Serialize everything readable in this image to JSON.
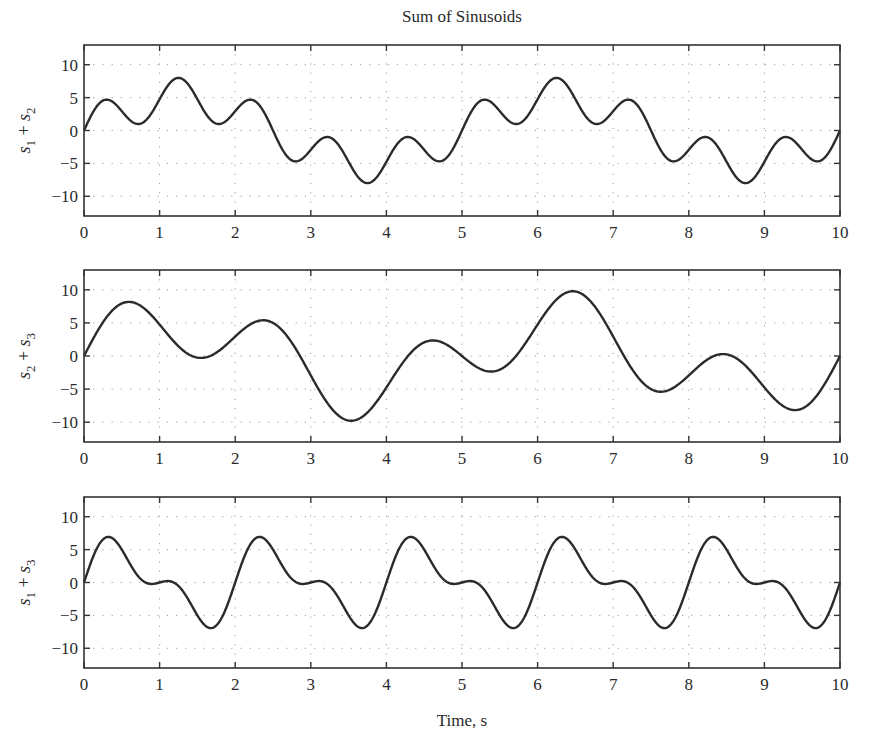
{
  "figure": {
    "title": "Sum of Sinusoids",
    "xlabel": "Time, s"
  },
  "chart_data": [
    {
      "type": "line",
      "title": "Sum of Sinusoids",
      "ylabel_parts": [
        "s",
        "1",
        " + ",
        "s",
        "2"
      ],
      "ylabel": "s1 + s2",
      "xlabel": "",
      "xlim": [
        0,
        10
      ],
      "ylim": [
        -13,
        13
      ],
      "xticks": [
        0,
        1,
        2,
        3,
        4,
        5,
        6,
        7,
        8,
        9,
        10
      ],
      "yticks": [
        10,
        5,
        0,
        -5,
        -10
      ],
      "ytick_labels": [
        "10",
        "5",
        "0",
        "−5",
        "−10"
      ],
      "grid": true,
      "formula": "3*sin(2*pi*t) + 5*sin(0.4*pi*t)",
      "components": [
        {
          "amp": 3,
          "freq_hz": 1.0
        },
        {
          "amp": 5,
          "freq_hz": 0.2
        }
      ],
      "key_points": [
        {
          "t": 0.0,
          "y": 0.0
        },
        {
          "t": 0.3,
          "y": 4.8
        },
        {
          "t": 0.72,
          "y": 1.1
        },
        {
          "t": 1.25,
          "y": 8.0
        },
        {
          "t": 1.78,
          "y": 1.1
        },
        {
          "t": 2.2,
          "y": 4.8
        },
        {
          "t": 2.78,
          "y": -4.8
        },
        {
          "t": 3.22,
          "y": -1.1
        },
        {
          "t": 3.75,
          "y": -8.0
        },
        {
          "t": 4.28,
          "y": -1.1
        },
        {
          "t": 4.7,
          "y": -4.8
        },
        {
          "t": 5.3,
          "y": 4.8
        },
        {
          "t": 5.72,
          "y": 1.1
        },
        {
          "t": 6.25,
          "y": 8.0
        },
        {
          "t": 6.78,
          "y": 1.1
        },
        {
          "t": 7.2,
          "y": 4.8
        },
        {
          "t": 7.78,
          "y": -4.8
        },
        {
          "t": 8.22,
          "y": -1.1
        },
        {
          "t": 8.75,
          "y": -8.0
        },
        {
          "t": 9.28,
          "y": -1.1
        },
        {
          "t": 9.7,
          "y": -4.8
        },
        {
          "t": 10.0,
          "y": 0.0
        }
      ]
    },
    {
      "type": "line",
      "ylabel_parts": [
        "s",
        "2",
        " + ",
        "s",
        "3"
      ],
      "ylabel": "s2 + s3",
      "xlabel": "",
      "xlim": [
        0,
        10
      ],
      "ylim": [
        -13,
        13
      ],
      "xticks": [
        0,
        1,
        2,
        3,
        4,
        5,
        6,
        7,
        8,
        9,
        10
      ],
      "yticks": [
        10,
        5,
        0,
        -5,
        -10
      ],
      "ytick_labels": [
        "10",
        "5",
        "0",
        "−5",
        "−10"
      ],
      "grid": true,
      "formula": "5*sin(0.4*pi*t) + 5*sin(pi*t)",
      "components": [
        {
          "amp": 5,
          "freq_hz": 0.2
        },
        {
          "amp": 5,
          "freq_hz": 0.5
        }
      ],
      "key_points": [
        {
          "t": 0.0,
          "y": 0.0
        },
        {
          "t": 0.6,
          "y": 8.2
        },
        {
          "t": 1.55,
          "y": -0.2
        },
        {
          "t": 2.4,
          "y": 5.3
        },
        {
          "t": 3.5,
          "y": -9.8
        },
        {
          "t": 4.6,
          "y": 2.2
        },
        {
          "t": 5.4,
          "y": -2.2
        },
        {
          "t": 6.5,
          "y": 9.8
        },
        {
          "t": 7.6,
          "y": -5.3
        },
        {
          "t": 8.45,
          "y": 0.2
        },
        {
          "t": 9.4,
          "y": -8.2
        },
        {
          "t": 10.0,
          "y": 0.0
        }
      ]
    },
    {
      "type": "line",
      "ylabel_parts": [
        "s",
        "1",
        " + ",
        "s",
        "3"
      ],
      "ylabel": "s1 + s3",
      "xlabel": "Time, s",
      "xlim": [
        0,
        10
      ],
      "ylim": [
        -13,
        13
      ],
      "xticks": [
        0,
        1,
        2,
        3,
        4,
        5,
        6,
        7,
        8,
        9,
        10
      ],
      "yticks": [
        10,
        5,
        0,
        -5,
        -10
      ],
      "ytick_labels": [
        "10",
        "5",
        "0",
        "−5",
        "−10"
      ],
      "grid": true,
      "formula": "3*sin(2*pi*t) + 5*sin(pi*t)",
      "components": [
        {
          "amp": 3,
          "freq_hz": 1.0
        },
        {
          "amp": 5,
          "freq_hz": 0.5
        }
      ],
      "key_points": [
        {
          "t": 0.0,
          "y": 0.0
        },
        {
          "t": 0.33,
          "y": 6.9
        },
        {
          "t": 0.9,
          "y": -0.2
        },
        {
          "t": 1.1,
          "y": 0.2
        },
        {
          "t": 1.67,
          "y": -6.9
        },
        {
          "t": 2.33,
          "y": 6.9
        },
        {
          "t": 3.67,
          "y": -6.9
        },
        {
          "t": 4.33,
          "y": 6.9
        },
        {
          "t": 5.67,
          "y": -6.9
        },
        {
          "t": 6.33,
          "y": 6.9
        },
        {
          "t": 7.67,
          "y": -6.9
        },
        {
          "t": 8.33,
          "y": 6.9
        },
        {
          "t": 9.67,
          "y": -6.9
        },
        {
          "t": 10.0,
          "y": 0.0
        }
      ]
    }
  ],
  "style": {
    "line_color": "#2b2b2b",
    "axis_color": "#333333",
    "grid_color": "#9a9a9a",
    "background": "#ffffff"
  }
}
